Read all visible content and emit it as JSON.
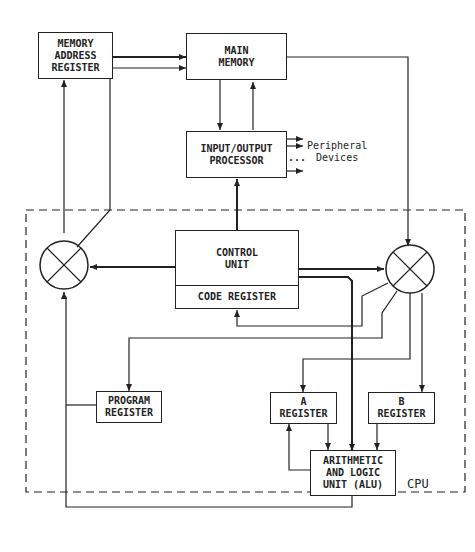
{
  "diagram": {
    "nodes": {
      "mar": "MEMORY\nADDRESS\nREGISTER",
      "main_memory": "MAIN\nMEMORY",
      "io_processor": "INPUT/OUTPUT\nPROCESSOR",
      "control_unit": "CONTROL\nUNIT",
      "code_register": "CODE REGISTER",
      "program_register": "PROGRAM\nREGISTER",
      "a_register": "A\nREGISTER",
      "b_register": "B\nREGISTER",
      "alu": "ARITHMETIC\nAND LOGIC\nUNIT (ALU)"
    },
    "labels": {
      "peripheral": "Peripheral\nDevices",
      "dots": "...",
      "cpu": "CPU"
    },
    "colors": {
      "line": "#222222",
      "background": "#ffffff"
    }
  }
}
